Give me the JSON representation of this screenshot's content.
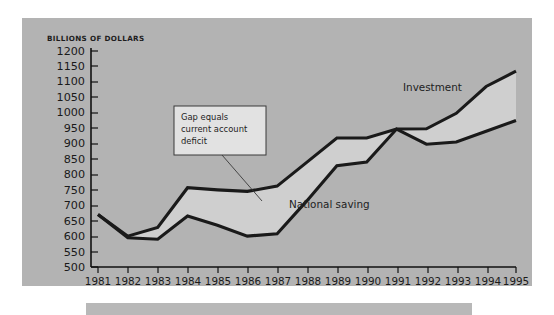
{
  "chart_data": {
    "type": "line",
    "title": "",
    "xlabel": "",
    "ylabel": "BILLIONS OF DOLLARS",
    "ylim": [
      500,
      1200
    ],
    "ytick_step": 50,
    "grid": false,
    "legend": "inline-labels",
    "categories": [
      "1981",
      "1982",
      "1983",
      "1984",
      "1985",
      "1986",
      "1987",
      "1988",
      "1989",
      "1990",
      "1991",
      "1992",
      "1993",
      "1994",
      "1995"
    ],
    "series": [
      {
        "name": "Investment",
        "values": [
          670,
          600,
          628,
          757,
          750,
          745,
          762,
          840,
          918,
          918,
          947,
          948,
          998,
          1085,
          1135
        ]
      },
      {
        "name": "National saving",
        "values": [
          670,
          595,
          590,
          665,
          635,
          600,
          608,
          715,
          828,
          840,
          947,
          898,
          905,
          940,
          975
        ]
      }
    ],
    "annotations": [
      {
        "name": "gap-callout",
        "lines": [
          "Gap equals",
          "current account",
          "deficit"
        ],
        "points_to_year": "1987"
      }
    ],
    "yticks": [
      "1200",
      "1150",
      "1100",
      "1050",
      "1000",
      "950",
      "900",
      "850",
      "800",
      "750",
      "700",
      "650",
      "600",
      "550",
      "500"
    ],
    "colors": {
      "panel_background": "#b3b3b3",
      "line": "#1a1a1a",
      "gap_fill": "#cfcfcf",
      "callout_background": "#e2e2e2",
      "text": "#1a1a1a"
    }
  },
  "axis": {
    "y_title": "BILLIONS OF DOLLARS"
  },
  "series_labels": {
    "investment": "Investment",
    "national_saving": "National saving"
  },
  "callout": {
    "line1": "Gap equals",
    "line2": "current account",
    "line3": "deficit"
  }
}
